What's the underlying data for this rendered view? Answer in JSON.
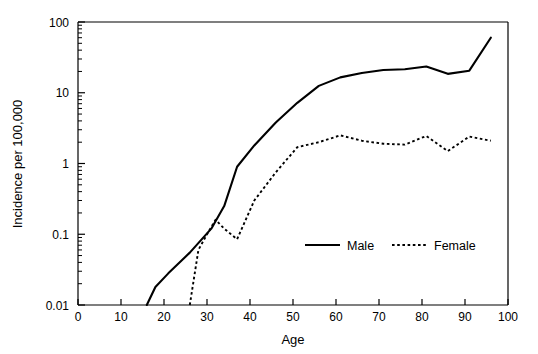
{
  "chart_data": {
    "type": "line",
    "title": "",
    "xlabel": "Age",
    "ylabel": "Incidence per 100,000",
    "xlim": [
      0,
      100
    ],
    "ylim": [
      0.01,
      100
    ],
    "yscale": "log",
    "xscale": "linear",
    "grid": false,
    "legend_position": "inside-lower-right",
    "x_ticks": [
      0,
      10,
      20,
      30,
      40,
      50,
      60,
      70,
      80,
      90,
      100
    ],
    "x_tick_labels": [
      "0",
      "10",
      "20",
      "30",
      "40",
      "50",
      "60",
      "70",
      "80",
      "90",
      "100"
    ],
    "y_ticks": [
      0.01,
      0.1,
      1,
      10,
      100
    ],
    "y_tick_labels": [
      "0.01",
      "0.1",
      "1",
      "10",
      "100"
    ],
    "series": [
      {
        "name": "Male",
        "style": "solid",
        "color": "#000000",
        "x": [
          16,
          18,
          21,
          26,
          31,
          34,
          37,
          41,
          46,
          51,
          56,
          61,
          66,
          71,
          76,
          81,
          86,
          91,
          96
        ],
        "y": [
          0.01,
          0.018,
          0.028,
          0.055,
          0.12,
          0.25,
          0.9,
          1.8,
          3.8,
          7.2,
          12.5,
          16.5,
          19.0,
          21.0,
          21.5,
          23.5,
          18.5,
          20.5,
          60.0
        ]
      },
      {
        "name": "Female",
        "style": "dotted",
        "color": "#000000",
        "x": [
          26,
          28,
          30,
          32,
          34,
          37,
          41,
          46,
          51,
          56,
          61,
          66,
          71,
          76,
          81,
          86,
          91,
          96
        ],
        "y": [
          0.01,
          0.06,
          0.1,
          0.16,
          0.12,
          0.085,
          0.3,
          0.75,
          1.7,
          2.0,
          2.5,
          2.1,
          1.9,
          1.85,
          2.45,
          1.5,
          2.4,
          2.1
        ]
      }
    ]
  },
  "legend": {
    "entries": [
      {
        "label": "Male",
        "style": "solid"
      },
      {
        "label": "Female",
        "style": "dotted"
      }
    ]
  },
  "axes": {
    "x_title": "Age",
    "y_title": "Incidence per 100,000"
  }
}
